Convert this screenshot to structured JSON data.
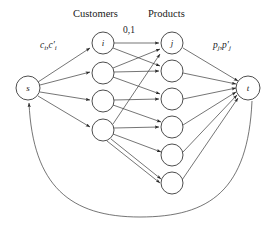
{
  "figure": {
    "type": "flow-network-diagram",
    "background": "#ffffff",
    "stroke_color": "#3a3a3a",
    "text_color": "#1a1a1a",
    "width": 274,
    "height": 227
  },
  "column_titles": {
    "customers": "Customers",
    "products": "Products"
  },
  "edge_labels": {
    "source_capacity": "c",
    "source_capacity_sub": "i",
    "source_capacity_second": "c",
    "source_capacity_second_sub": "i",
    "source_capacity_full": "c_i,c'_i",
    "middle_capacity": "0,1",
    "sink_capacity": "p",
    "sink_capacity_sub": "j",
    "sink_capacity_second": "p",
    "sink_capacity_second_sub": "j",
    "sink_capacity_full": "p_j,p'_j"
  },
  "nodes": {
    "source": {
      "label": "s",
      "cx": 28,
      "cy": 88,
      "r": 12
    },
    "sink": {
      "label": "t",
      "cx": 248,
      "cy": 88,
      "r": 12
    },
    "customers": [
      {
        "label": "i",
        "cx": 103,
        "cy": 43,
        "r": 11
      },
      {
        "label": "",
        "cx": 103,
        "cy": 73,
        "r": 11
      },
      {
        "label": "",
        "cx": 103,
        "cy": 101,
        "r": 11
      },
      {
        "label": "",
        "cx": 103,
        "cy": 130,
        "r": 11
      }
    ],
    "products": [
      {
        "label": "j",
        "cx": 172,
        "cy": 43,
        "r": 11
      },
      {
        "label": "",
        "cx": 172,
        "cy": 71,
        "r": 11
      },
      {
        "label": "",
        "cx": 172,
        "cy": 99,
        "r": 11
      },
      {
        "label": "",
        "cx": 172,
        "cy": 127,
        "r": 11
      },
      {
        "label": "",
        "cx": 172,
        "cy": 155,
        "r": 11
      },
      {
        "label": "",
        "cx": 172,
        "cy": 183,
        "r": 11
      }
    ]
  },
  "edges": {
    "source_to_customers": [
      [
        0,
        0
      ],
      [
        0,
        1
      ],
      [
        0,
        2
      ],
      [
        0,
        3
      ]
    ],
    "customers_to_products": [
      [
        0,
        0
      ],
      [
        0,
        1
      ],
      [
        1,
        0
      ],
      [
        1,
        1
      ],
      [
        1,
        2
      ],
      [
        2,
        2
      ],
      [
        2,
        3
      ],
      [
        3,
        0
      ],
      [
        3,
        3
      ],
      [
        3,
        4
      ],
      [
        3,
        5
      ],
      [
        3,
        5
      ]
    ],
    "products_to_sink": [
      0,
      1,
      2,
      3,
      4,
      5
    ],
    "return_arc": "t-to-s"
  }
}
